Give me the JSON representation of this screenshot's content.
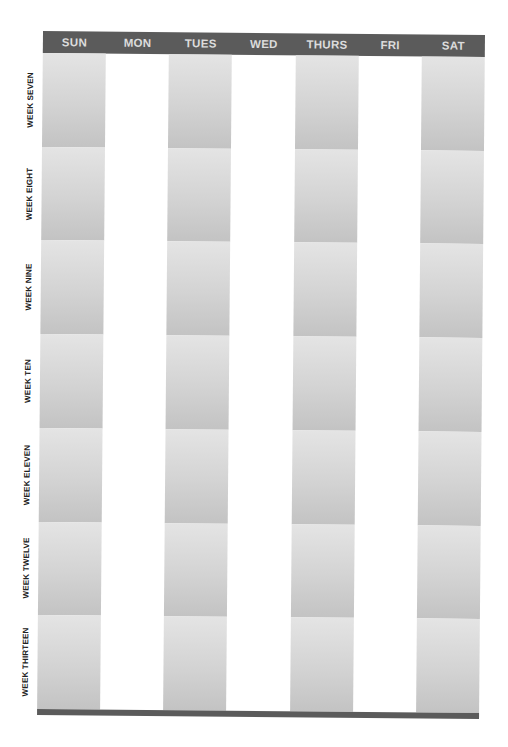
{
  "calendar": {
    "days": [
      {
        "label": "SUN",
        "shaded": true
      },
      {
        "label": "MON",
        "shaded": false
      },
      {
        "label": "TUES",
        "shaded": true
      },
      {
        "label": "WED",
        "shaded": false
      },
      {
        "label": "THURS",
        "shaded": true
      },
      {
        "label": "FRI",
        "shaded": false
      },
      {
        "label": "SAT",
        "shaded": true
      }
    ],
    "weeks": [
      {
        "label": "WEEK SEVEN"
      },
      {
        "label": "WEEK EIGHT"
      },
      {
        "label": "WEEK NINE"
      },
      {
        "label": "WEEK TEN"
      },
      {
        "label": "WEEK ELEVEN"
      },
      {
        "label": "WEEK TWELVE"
      },
      {
        "label": "WEEK THIRTEEN"
      }
    ]
  },
  "colors": {
    "header_bar": "#5b5b5b",
    "header_text": "#dcdcdc",
    "cell_shade_top": "#e4e4e4",
    "cell_shade_bottom": "#c3c3c3",
    "label_text": "#222222"
  }
}
